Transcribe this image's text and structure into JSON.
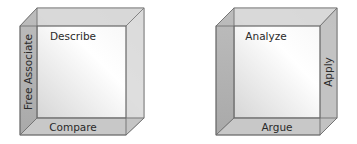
{
  "cubes": [
    {
      "name": "left-cube",
      "top_face_label": "Describe",
      "left_face_label": "Free Associate",
      "bottom_face_label": "Compare"
    },
    {
      "name": "right-cube",
      "top_face_label": "Analyze",
      "right_face_label": "Apply",
      "bottom_face_label": "Argue"
    }
  ],
  "colors": {
    "face_shaded": "#b8b8b8",
    "face_light": "#d4d4d4",
    "edge": "#6a6a6a",
    "text": "#2a2a2a"
  }
}
